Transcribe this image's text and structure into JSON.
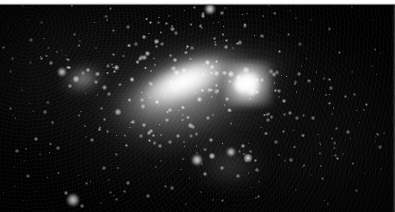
{
  "image": {
    "kind": "astronomical-photograph",
    "subject": "irregular barred galaxy (Magellanic-type) with resolved star field",
    "medium": "scanned photographic plate, black and white",
    "width_px": 395,
    "height_px": 212,
    "background_color": "#000000",
    "page_margin_color": "#ffffff",
    "page_margin_height_px": 5,
    "highlight_color": "#ffffff"
  },
  "scene": {
    "galaxy_bar": {
      "label": "central bar",
      "center_x": 187,
      "center_y": 81,
      "length_px": 150,
      "width_px": 62,
      "angle_deg": -22,
      "peak_brightness": "#ffffff"
    },
    "halo": {
      "label": "diffuse halo",
      "center_x": 187,
      "center_y": 102,
      "width_px": 270,
      "height_px": 168,
      "angle_deg": -19
    },
    "nebula_knot": {
      "label": "bright nebular knot",
      "center_x": 248,
      "center_y": 84,
      "radius_px": 24
    }
  },
  "bright_sources": [
    {
      "x": 210,
      "y": 9,
      "r": 5.0,
      "i": 1.0
    },
    {
      "x": 203,
      "y": 16,
      "r": 2.4,
      "i": 0.7
    },
    {
      "x": 222,
      "y": 13,
      "r": 1.8,
      "i": 0.55
    },
    {
      "x": 73,
      "y": 200,
      "r": 6.0,
      "i": 1.0
    },
    {
      "x": 66,
      "y": 193,
      "r": 2.2,
      "i": 0.65
    },
    {
      "x": 82,
      "y": 206,
      "r": 2.0,
      "i": 0.6
    },
    {
      "x": 240,
      "y": 84,
      "r": 7.5,
      "i": 1.0
    },
    {
      "x": 252,
      "y": 92,
      "r": 4.0,
      "i": 0.88
    },
    {
      "x": 231,
      "y": 74,
      "r": 3.4,
      "i": 0.82
    },
    {
      "x": 246,
      "y": 70,
      "r": 2.6,
      "i": 0.72
    },
    {
      "x": 262,
      "y": 80,
      "r": 2.2,
      "i": 0.62
    },
    {
      "x": 197,
      "y": 160,
      "r": 4.6,
      "i": 0.95
    },
    {
      "x": 212,
      "y": 156,
      "r": 3.2,
      "i": 0.8
    },
    {
      "x": 231,
      "y": 152,
      "r": 4.2,
      "i": 0.92
    },
    {
      "x": 248,
      "y": 158,
      "r": 3.6,
      "i": 0.85
    },
    {
      "x": 243,
      "y": 146,
      "r": 2.4,
      "i": 0.68
    },
    {
      "x": 222,
      "y": 168,
      "r": 2.0,
      "i": 0.6
    },
    {
      "x": 205,
      "y": 174,
      "r": 2.2,
      "i": 0.62
    },
    {
      "x": 238,
      "y": 176,
      "r": 1.8,
      "i": 0.52
    },
    {
      "x": 257,
      "y": 170,
      "r": 1.7,
      "i": 0.5
    },
    {
      "x": 62,
      "y": 72,
      "r": 3.8,
      "i": 0.9
    },
    {
      "x": 76,
      "y": 79,
      "r": 2.6,
      "i": 0.72
    },
    {
      "x": 88,
      "y": 70,
      "r": 2.4,
      "i": 0.68
    },
    {
      "x": 70,
      "y": 86,
      "r": 2.0,
      "i": 0.58
    },
    {
      "x": 96,
      "y": 82,
      "r": 1.8,
      "i": 0.52
    },
    {
      "x": 51,
      "y": 63,
      "r": 1.9,
      "i": 0.55
    },
    {
      "x": 118,
      "y": 112,
      "r": 2.6,
      "i": 0.72
    },
    {
      "x": 133,
      "y": 122,
      "r": 2.2,
      "i": 0.62
    },
    {
      "x": 151,
      "y": 131,
      "r": 2.4,
      "i": 0.66
    },
    {
      "x": 167,
      "y": 120,
      "r": 2.0,
      "i": 0.58
    },
    {
      "x": 178,
      "y": 136,
      "r": 2.2,
      "i": 0.6
    },
    {
      "x": 193,
      "y": 127,
      "r": 1.8,
      "i": 0.52
    },
    {
      "x": 208,
      "y": 118,
      "r": 2.0,
      "i": 0.56
    },
    {
      "x": 160,
      "y": 146,
      "r": 1.9,
      "i": 0.54
    },
    {
      "x": 142,
      "y": 100,
      "r": 1.8,
      "i": 0.5
    },
    {
      "x": 109,
      "y": 94,
      "r": 1.7,
      "i": 0.48
    },
    {
      "x": 36,
      "y": 139,
      "r": 2.0,
      "i": 0.56
    },
    {
      "x": 17,
      "y": 151,
      "r": 1.8,
      "i": 0.5
    },
    {
      "x": 58,
      "y": 148,
      "r": 1.6,
      "i": 0.45
    },
    {
      "x": 28,
      "y": 176,
      "r": 1.7,
      "i": 0.47
    },
    {
      "x": 10,
      "y": 108,
      "r": 1.5,
      "i": 0.42
    },
    {
      "x": 45,
      "y": 112,
      "r": 1.6,
      "i": 0.44
    },
    {
      "x": 12,
      "y": 58,
      "r": 1.5,
      "i": 0.4
    },
    {
      "x": 31,
      "y": 40,
      "r": 1.6,
      "i": 0.43
    },
    {
      "x": 22,
      "y": 90,
      "r": 1.4,
      "i": 0.38
    },
    {
      "x": 92,
      "y": 140,
      "r": 1.7,
      "i": 0.46
    },
    {
      "x": 104,
      "y": 168,
      "r": 1.6,
      "i": 0.44
    },
    {
      "x": 128,
      "y": 183,
      "r": 1.8,
      "i": 0.5
    },
    {
      "x": 148,
      "y": 196,
      "r": 1.7,
      "i": 0.46
    },
    {
      "x": 172,
      "y": 188,
      "r": 1.6,
      "i": 0.44
    },
    {
      "x": 116,
      "y": 199,
      "r": 1.5,
      "i": 0.4
    },
    {
      "x": 284,
      "y": 101,
      "r": 2.4,
      "i": 0.7
    },
    {
      "x": 299,
      "y": 74,
      "r": 1.9,
      "i": 0.52
    },
    {
      "x": 313,
      "y": 118,
      "r": 1.8,
      "i": 0.5
    },
    {
      "x": 331,
      "y": 88,
      "r": 1.6,
      "i": 0.44
    },
    {
      "x": 348,
      "y": 132,
      "r": 1.7,
      "i": 0.47
    },
    {
      "x": 366,
      "y": 104,
      "r": 1.5,
      "i": 0.41
    },
    {
      "x": 380,
      "y": 147,
      "r": 1.6,
      "i": 0.43
    },
    {
      "x": 291,
      "y": 160,
      "r": 1.7,
      "i": 0.46
    },
    {
      "x": 322,
      "y": 178,
      "r": 1.5,
      "i": 0.4
    },
    {
      "x": 356,
      "y": 190,
      "r": 1.5,
      "i": 0.4
    },
    {
      "x": 339,
      "y": 52,
      "r": 1.5,
      "i": 0.4
    },
    {
      "x": 372,
      "y": 66,
      "r": 1.4,
      "i": 0.37
    },
    {
      "x": 288,
      "y": 34,
      "r": 1.5,
      "i": 0.4
    },
    {
      "x": 311,
      "y": 20,
      "r": 1.4,
      "i": 0.36
    },
    {
      "x": 262,
      "y": 36,
      "r": 1.8,
      "i": 0.5
    },
    {
      "x": 245,
      "y": 26,
      "r": 1.6,
      "i": 0.44
    },
    {
      "x": 176,
      "y": 33,
      "r": 1.7,
      "i": 0.46
    },
    {
      "x": 158,
      "y": 22,
      "r": 1.5,
      "i": 0.41
    },
    {
      "x": 136,
      "y": 44,
      "r": 1.6,
      "i": 0.43
    },
    {
      "x": 113,
      "y": 30,
      "r": 1.5,
      "i": 0.4
    },
    {
      "x": 96,
      "y": 48,
      "r": 1.4,
      "i": 0.37
    },
    {
      "x": 74,
      "y": 34,
      "r": 1.5,
      "i": 0.39
    },
    {
      "x": 192,
      "y": 48,
      "r": 1.6,
      "i": 0.44
    },
    {
      "x": 215,
      "y": 44,
      "r": 1.5,
      "i": 0.41
    },
    {
      "x": 268,
      "y": 120,
      "r": 1.8,
      "i": 0.48
    },
    {
      "x": 276,
      "y": 142,
      "r": 1.6,
      "i": 0.43
    },
    {
      "x": 258,
      "y": 196,
      "r": 1.5,
      "i": 0.4
    },
    {
      "x": 186,
      "y": 204,
      "r": 1.4,
      "i": 0.37
    },
    {
      "x": 222,
      "y": 200,
      "r": 1.5,
      "i": 0.39
    }
  ],
  "field_stars_seed": 20250,
  "field_stars_count": 620
}
